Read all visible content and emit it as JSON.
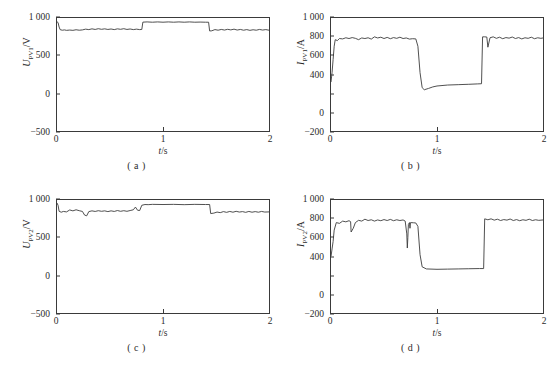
{
  "figure": {
    "panels": [
      {
        "id": "a",
        "caption": "( a )",
        "y_symbol": "U",
        "y_subscript": "PV1",
        "y_unit": "/V",
        "x_title_symbol": "t",
        "x_title_unit": "/s",
        "y_ticks": [
          "1 000",
          "500",
          "0",
          "−500"
        ],
        "x_ticks": [
          "0",
          "1",
          "2"
        ]
      },
      {
        "id": "b",
        "caption": "( b )",
        "y_symbol": "I",
        "y_subscript": "PV1",
        "y_unit": "/A",
        "x_title_symbol": "t",
        "x_title_unit": "/s",
        "y_ticks": [
          "1 000",
          "800",
          "600",
          "400",
          "0",
          "−200"
        ],
        "x_ticks": [
          "0",
          "1",
          "2"
        ]
      },
      {
        "id": "c",
        "caption": "( c )",
        "y_symbol": "U",
        "y_subscript": "PV2",
        "y_unit": "/V",
        "x_title_symbol": "t",
        "x_title_unit": "/s",
        "y_ticks": [
          "1 000",
          "500",
          "0",
          "−500"
        ],
        "x_ticks": [
          "0",
          "1",
          "2"
        ]
      },
      {
        "id": "d",
        "caption": "( d )",
        "y_symbol": "I",
        "y_subscript": "PV2",
        "y_unit": "/A",
        "x_title_symbol": "t",
        "x_title_unit": "/s",
        "y_ticks": [
          "1 000",
          "800",
          "600",
          "400",
          "0",
          "−200"
        ],
        "x_ticks": [
          "0",
          "1",
          "2"
        ]
      }
    ]
  },
  "style": {
    "trace_color": "#3c3c3c",
    "axis_color": "#3a3a3a",
    "background": "#ffffff"
  },
  "chart_data": [
    {
      "type": "line",
      "panel": "a",
      "title": "( a )",
      "xlabel": "t/s",
      "ylabel": "U_PV1 /V",
      "xlim": [
        0,
        2
      ],
      "ylim": [
        -500,
        1000
      ],
      "ytick_values": [
        1000,
        500,
        0,
        -500
      ],
      "xtick_values": [
        0,
        1,
        2
      ],
      "grid": false,
      "legend": "none",
      "series": [
        {
          "name": "U_PV1",
          "x": [
            0.0,
            0.01,
            0.02,
            0.03,
            0.05,
            0.07,
            0.09,
            0.12,
            0.15,
            0.18,
            0.21,
            0.24,
            0.27,
            0.3,
            0.33,
            0.36,
            0.39,
            0.42,
            0.45,
            0.48,
            0.51,
            0.54,
            0.57,
            0.6,
            0.63,
            0.66,
            0.69,
            0.72,
            0.75,
            0.78,
            0.8,
            0.81,
            0.85,
            0.9,
            0.95,
            1.0,
            1.05,
            1.1,
            1.15,
            1.2,
            1.25,
            1.3,
            1.35,
            1.4,
            1.43,
            1.44,
            1.46,
            1.49,
            1.52,
            1.55,
            1.58,
            1.61,
            1.64,
            1.67,
            1.7,
            1.73,
            1.76,
            1.79,
            1.82,
            1.85,
            1.88,
            1.91,
            1.94,
            1.97,
            2.0
          ],
          "y": [
            950,
            940,
            880,
            845,
            838,
            842,
            836,
            840,
            836,
            844,
            838,
            842,
            852,
            846,
            856,
            848,
            858,
            850,
            856,
            848,
            854,
            846,
            856,
            850,
            858,
            848,
            854,
            846,
            852,
            846,
            848,
            945,
            948,
            944,
            948,
            944,
            948,
            944,
            948,
            944,
            948,
            944,
            946,
            944,
            944,
            828,
            830,
            846,
            838,
            848,
            840,
            850,
            842,
            852,
            840,
            848,
            838,
            846,
            836,
            844,
            838,
            848,
            840,
            846,
            838
          ]
        }
      ]
    },
    {
      "type": "line",
      "panel": "b",
      "title": "( b )",
      "xlabel": "t/s",
      "ylabel": "I_PV1 /A",
      "xlim": [
        0,
        2
      ],
      "ylim": [
        -200,
        1000
      ],
      "ytick_values": [
        1000,
        800,
        600,
        400,
        200,
        0,
        -200
      ],
      "ytick_labels_shown": [
        1000,
        800,
        600,
        400,
        0,
        -200
      ],
      "xtick_values": [
        0,
        1,
        2
      ],
      "grid": false,
      "legend": "none",
      "series": [
        {
          "name": "I_PV1",
          "x": [
            0.0,
            0.01,
            0.02,
            0.03,
            0.04,
            0.06,
            0.08,
            0.11,
            0.14,
            0.17,
            0.2,
            0.23,
            0.26,
            0.29,
            0.32,
            0.35,
            0.38,
            0.41,
            0.44,
            0.47,
            0.5,
            0.53,
            0.56,
            0.59,
            0.62,
            0.65,
            0.68,
            0.71,
            0.74,
            0.77,
            0.8,
            0.82,
            0.84,
            0.86,
            0.88,
            0.92,
            0.96,
            1.0,
            1.1,
            1.2,
            1.3,
            1.38,
            1.42,
            1.43,
            1.45,
            1.47,
            1.48,
            1.5,
            1.53,
            1.56,
            1.59,
            1.62,
            1.65,
            1.68,
            1.71,
            1.74,
            1.77,
            1.8,
            1.83,
            1.86,
            1.89,
            1.92,
            1.95,
            1.98,
            2.0
          ],
          "y": [
            320,
            420,
            560,
            700,
            770,
            760,
            782,
            778,
            790,
            782,
            792,
            784,
            770,
            788,
            782,
            790,
            776,
            800,
            788,
            796,
            782,
            794,
            780,
            792,
            784,
            796,
            782,
            788,
            776,
            780,
            778,
            700,
            420,
            260,
            238,
            252,
            268,
            278,
            288,
            292,
            296,
            300,
            302,
            800,
            800,
            798,
            690,
            790,
            800,
            784,
            796,
            780,
            792,
            786,
            798,
            782,
            792,
            778,
            790,
            784,
            796,
            780,
            790,
            784,
            788
          ]
        }
      ]
    },
    {
      "type": "line",
      "panel": "c",
      "title": "( c )",
      "xlabel": "t/s",
      "ylabel": "U_PV2 /V",
      "xlim": [
        0,
        2
      ],
      "ylim": [
        -500,
        1000
      ],
      "ytick_values": [
        1000,
        500,
        0,
        -500
      ],
      "xtick_values": [
        0,
        1,
        2
      ],
      "grid": false,
      "legend": "none",
      "series": [
        {
          "name": "U_PV2",
          "x": [
            0.0,
            0.01,
            0.02,
            0.04,
            0.06,
            0.09,
            0.12,
            0.15,
            0.18,
            0.21,
            0.24,
            0.26,
            0.28,
            0.3,
            0.33,
            0.36,
            0.39,
            0.42,
            0.45,
            0.48,
            0.51,
            0.54,
            0.57,
            0.6,
            0.63,
            0.66,
            0.69,
            0.72,
            0.74,
            0.76,
            0.78,
            0.8,
            0.83,
            0.86,
            0.9,
            1.0,
            1.1,
            1.2,
            1.3,
            1.4,
            1.44,
            1.45,
            1.48,
            1.51,
            1.54,
            1.57,
            1.6,
            1.63,
            1.66,
            1.69,
            1.72,
            1.75,
            1.78,
            1.81,
            1.84,
            1.87,
            1.9,
            1.93,
            1.96,
            2.0
          ],
          "y": [
            960,
            930,
            850,
            838,
            848,
            842,
            868,
            856,
            870,
            858,
            848,
            800,
            790,
            846,
            856,
            848,
            858,
            850,
            856,
            846,
            856,
            848,
            860,
            850,
            858,
            850,
            860,
            870,
            906,
            864,
            860,
            930,
            940,
            938,
            942,
            940,
            942,
            938,
            942,
            940,
            940,
            820,
            826,
            840,
            832,
            846,
            836,
            848,
            838,
            850,
            840,
            846,
            836,
            848,
            838,
            846,
            838,
            848,
            840,
            842
          ]
        }
      ]
    },
    {
      "type": "line",
      "panel": "d",
      "title": "( d )",
      "xlabel": "t/s",
      "ylabel": "I_PV2 /A",
      "xlim": [
        0,
        2
      ],
      "ylim": [
        -200,
        1000
      ],
      "ytick_values": [
        1000,
        800,
        600,
        400,
        200,
        0,
        -200
      ],
      "ytick_labels_shown": [
        1000,
        800,
        600,
        400,
        0,
        -200
      ],
      "xtick_values": [
        0,
        1,
        2
      ],
      "grid": false,
      "legend": "none",
      "series": [
        {
          "name": "I_PV2",
          "x": [
            0.0,
            0.01,
            0.02,
            0.03,
            0.05,
            0.08,
            0.11,
            0.14,
            0.17,
            0.185,
            0.19,
            0.2,
            0.21,
            0.23,
            0.26,
            0.29,
            0.32,
            0.35,
            0.38,
            0.41,
            0.44,
            0.47,
            0.5,
            0.53,
            0.56,
            0.59,
            0.62,
            0.65,
            0.68,
            0.7,
            0.715,
            0.72,
            0.725,
            0.73,
            0.74,
            0.745,
            0.75,
            0.78,
            0.8,
            0.82,
            0.84,
            0.86,
            0.9,
            1.0,
            1.1,
            1.2,
            1.3,
            1.4,
            1.44,
            1.45,
            1.48,
            1.51,
            1.54,
            1.57,
            1.6,
            1.63,
            1.66,
            1.69,
            1.72,
            1.75,
            1.78,
            1.81,
            1.84,
            1.87,
            1.9,
            1.93,
            1.96,
            2.0
          ],
          "y": [
            400,
            480,
            560,
            680,
            760,
            752,
            776,
            768,
            780,
            770,
            660,
            680,
            700,
            760,
            784,
            776,
            796,
            782,
            790,
            776,
            788,
            780,
            792,
            782,
            794,
            780,
            790,
            782,
            788,
            776,
            640,
            490,
            600,
            740,
            760,
            700,
            760,
            758,
            756,
            720,
            420,
            290,
            268,
            264,
            266,
            268,
            270,
            272,
            272,
            800,
            790,
            800,
            786,
            796,
            782,
            792,
            786,
            798,
            782,
            792,
            780,
            790,
            784,
            796,
            782,
            790,
            784,
            788
          ]
        }
      ]
    }
  ]
}
